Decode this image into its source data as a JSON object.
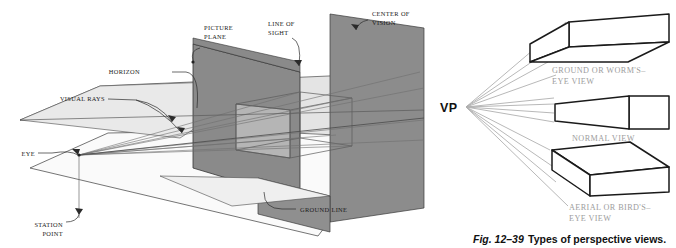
{
  "figure": {
    "caption_prefix": "Fig. 12–39",
    "caption_text": "Types of perspective views.",
    "vp_label": "VP"
  },
  "colors": {
    "plane_dark": "#8a8a8a",
    "plane_mid": "#c9c9c9",
    "plane_light": "#e2e2e2",
    "plane_pale": "#f2f2f2",
    "outline": "#2b2b2b",
    "ray": "#7d7d7d",
    "label_text": "#1a1a1a",
    "label_grey": "#9d9d9d",
    "background": "#ffffff"
  },
  "left_diagram": {
    "name": "perspective-setup-3d",
    "labels": [
      {
        "id": "horizon",
        "text": "HORIZON",
        "lines": [
          "HORIZON"
        ]
      },
      {
        "id": "picture-plane",
        "text": "PICTURE PLANE",
        "lines": [
          "PICTURE",
          "PLANE"
        ]
      },
      {
        "id": "line-of-sight",
        "text": "LINE OF SIGHT",
        "lines": [
          "LINE OF",
          "SIGHT"
        ]
      },
      {
        "id": "center-of-vision",
        "text": "CENTER OF VISION",
        "lines": [
          "CENTER OF",
          "VISION"
        ]
      },
      {
        "id": "visual-rays",
        "text": "VISUAL RAYS",
        "lines": [
          "VISUAL RAYS"
        ]
      },
      {
        "id": "eye",
        "text": "EYE",
        "lines": [
          "EYE"
        ]
      },
      {
        "id": "station-point",
        "text": "STATION POINT",
        "lines": [
          "STATION",
          "POINT"
        ]
      },
      {
        "id": "ground-line",
        "text": "GROUND LINE",
        "lines": [
          "GROUND LINE"
        ]
      }
    ]
  },
  "right_diagram": {
    "name": "types-of-views",
    "views": [
      {
        "id": "worms-eye-view",
        "lines": [
          "GROUND OR WORM'S–",
          "EYE VIEW"
        ],
        "text": "GROUND OR WORM'S–EYE VIEW"
      },
      {
        "id": "normal-view",
        "lines": [
          "NORMAL VIEW"
        ],
        "text": "NORMAL VIEW"
      },
      {
        "id": "birds-eye-view",
        "lines": [
          "AERIAL OR BIRD'S–",
          "EYE VIEW"
        ],
        "text": "AERIAL OR BIRD'S–EYE VIEW"
      }
    ]
  }
}
